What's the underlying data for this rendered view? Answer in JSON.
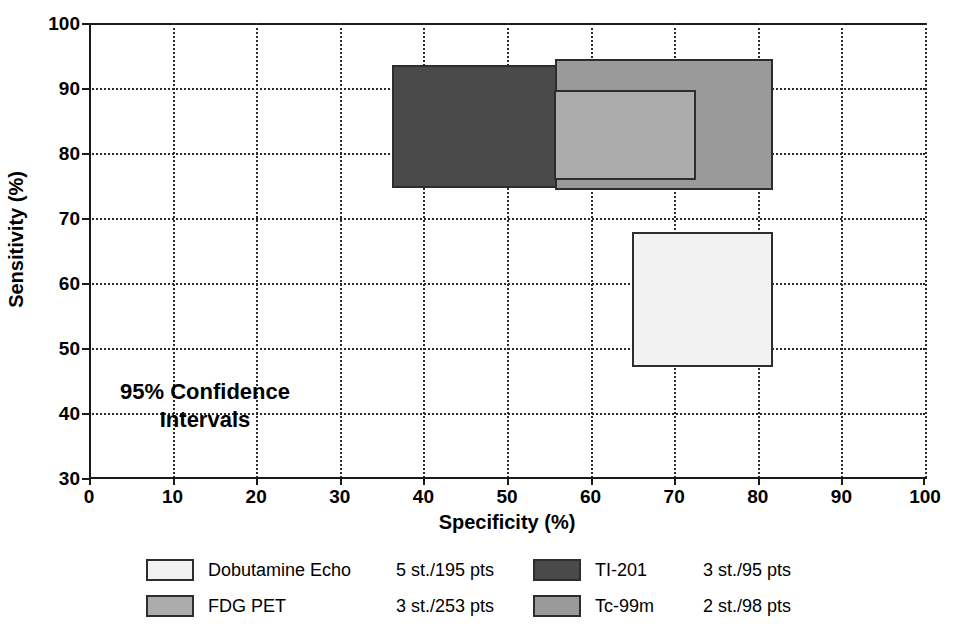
{
  "chart_data": {
    "type": "bar",
    "subtype": "confidence-interval-rectangles",
    "title": "",
    "xlabel": "Specificity (%)",
    "ylabel": "Sensitivity (%)",
    "xlim": [
      0,
      100
    ],
    "ylim": [
      30,
      100
    ],
    "xticks": [
      0,
      10,
      20,
      30,
      40,
      50,
      60,
      70,
      80,
      90,
      100
    ],
    "yticks": [
      30,
      40,
      50,
      60,
      70,
      80,
      90,
      100
    ],
    "grid": true,
    "legend_position": "bottom",
    "annotation": {
      "line1": "95% Confidence",
      "line2": "Intervals"
    },
    "series": [
      {
        "name": "Dobutamine Echo",
        "stats": "5 st./195 pts",
        "color": "#f2f2f2",
        "specificity_low": 65.0,
        "specificity_high": 81.8,
        "sensitivity_low": 47.0,
        "sensitivity_high": 67.8
      },
      {
        "name": "FDG PET",
        "stats": "3 st./253 pts",
        "color": "#acacac",
        "specificity_low": 55.6,
        "specificity_high": 72.6,
        "sensitivity_low": 75.8,
        "sensitivity_high": 89.7
      },
      {
        "name": "TI-201",
        "stats": "3 st./95 pts",
        "color": "#4a4a4a",
        "specificity_low": 36.2,
        "specificity_high": 70.2,
        "sensitivity_low": 74.6,
        "sensitivity_high": 93.5
      },
      {
        "name": "Tc-99m",
        "stats": "2 st./98 pts",
        "color": "#9a9a9a",
        "specificity_low": 55.7,
        "specificity_high": 81.8,
        "sensitivity_low": 74.3,
        "sensitivity_high": 94.5
      }
    ]
  },
  "axis": {
    "x_title": "Specificity (%)",
    "y_title": "Sensitivity (%)",
    "x_ticks": [
      "0",
      "10",
      "20",
      "30",
      "40",
      "50",
      "60",
      "70",
      "80",
      "90",
      "100"
    ],
    "y_ticks": [
      "100",
      "90",
      "80",
      "70",
      "60",
      "50",
      "40",
      "30"
    ]
  },
  "legend": {
    "left": [
      {
        "name": "Dobutamine Echo",
        "stats": "5 st./195 pts"
      },
      {
        "name": "FDG PET",
        "stats": "3 st./253 pts"
      }
    ],
    "right": [
      {
        "name": "TI-201",
        "stats": "3 st./95 pts"
      },
      {
        "name": "Tc-99m",
        "stats": "2 st./98 pts"
      }
    ]
  }
}
